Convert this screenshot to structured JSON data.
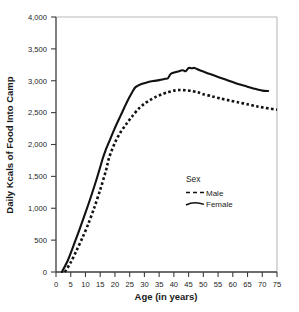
{
  "chart_data": {
    "type": "line",
    "title": "",
    "xlabel": "Age (in years)",
    "ylabel": "Daily Kcals of Food Into Camp",
    "xlim": [
      0,
      75
    ],
    "ylim": [
      0,
      4000
    ],
    "grid": false,
    "legend_position": "center-right-inside",
    "legend_title": "Sex",
    "x_ticks": [
      0,
      5,
      10,
      15,
      20,
      25,
      30,
      35,
      40,
      45,
      50,
      55,
      60,
      65,
      70,
      75
    ],
    "x_tick_labels": [
      "0",
      "5",
      "10",
      "15",
      "20",
      "25",
      "30",
      "35",
      "40",
      "45",
      "50",
      "55",
      "60",
      "65",
      "70",
      "75"
    ],
    "y_ticks": [
      0,
      500,
      1000,
      1500,
      2000,
      2500,
      3000,
      3500,
      4000
    ],
    "y_tick_labels": [
      "0",
      "500",
      "1,000",
      "1,500",
      "2,000",
      "2,500",
      "3,000",
      "3,500",
      "4,000"
    ],
    "series": [
      {
        "name": "Male",
        "style": "dashed",
        "color": "#111111",
        "x": [
          3,
          5,
          7,
          9,
          11,
          13,
          15,
          17,
          18,
          20,
          22,
          24,
          26,
          28,
          30,
          32,
          34,
          36,
          38,
          40,
          42,
          44,
          46,
          48,
          50,
          53,
          56,
          59,
          62,
          65,
          68,
          71,
          75
        ],
        "y": [
          0,
          150,
          340,
          540,
          760,
          1010,
          1290,
          1600,
          1790,
          2030,
          2200,
          2330,
          2450,
          2560,
          2640,
          2700,
          2750,
          2790,
          2820,
          2845,
          2855,
          2850,
          2840,
          2820,
          2790,
          2755,
          2720,
          2690,
          2660,
          2630,
          2600,
          2575,
          2545
        ]
      },
      {
        "name": "Female",
        "style": "solid",
        "color": "#111111",
        "x": [
          2,
          4,
          6,
          8,
          10,
          12,
          14,
          16,
          17,
          18,
          20,
          22,
          24,
          26,
          27,
          29,
          31,
          33,
          35,
          37,
          38,
          39,
          41,
          43,
          44,
          45,
          46,
          47,
          49,
          52,
          55,
          58,
          61,
          64,
          67,
          70,
          72
        ],
        "y": [
          0,
          180,
          420,
          670,
          930,
          1200,
          1490,
          1800,
          1930,
          2040,
          2260,
          2460,
          2660,
          2830,
          2900,
          2950,
          2975,
          2995,
          3010,
          3030,
          3040,
          3110,
          3140,
          3165,
          3150,
          3200,
          3195,
          3200,
          3160,
          3110,
          3060,
          3010,
          2960,
          2920,
          2880,
          2845,
          2840
        ]
      }
    ],
    "annotations": []
  },
  "legend": {
    "title": "Sex",
    "entries": [
      {
        "label": "Male",
        "style": "dashed"
      },
      {
        "label": "Female",
        "style": "solid"
      }
    ]
  },
  "colors": {
    "line": "#111111",
    "axis": "#4a4a4a",
    "frame": "#b8b8b8",
    "text": "#232323"
  }
}
